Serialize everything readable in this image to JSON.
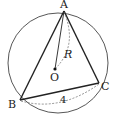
{
  "diagram": {
    "type": "geometry",
    "circle": {
      "center_label": "O",
      "cx": 58,
      "cy": 62,
      "r": 50
    },
    "points": {
      "A": {
        "label": "A",
        "x": 64,
        "y": 11
      },
      "B": {
        "label": "B",
        "x": 20,
        "y": 100
      },
      "C": {
        "label": "C",
        "x": 99,
        "y": 83
      },
      "O": {
        "label": "O",
        "x": 55,
        "y": 69
      }
    },
    "annotations": {
      "radius_label": "R",
      "side_bc_label": "4"
    },
    "colors": {
      "stroke": "#222222",
      "circle": "#444444",
      "dashed": "#666666"
    }
  }
}
